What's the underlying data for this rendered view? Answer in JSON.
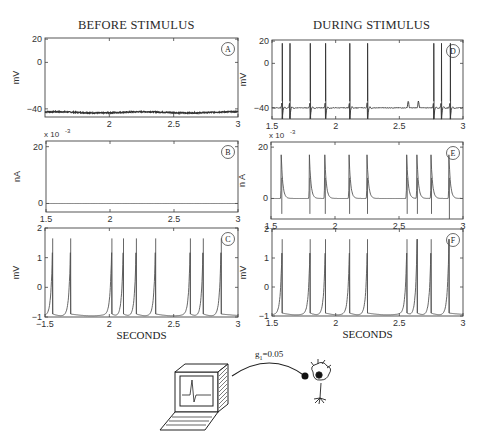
{
  "titles": {
    "left": "BEFORE STIMULUS",
    "right": "DURING STIMULUS"
  },
  "xlabel": "SECONDS",
  "scale_exponent": "x 10",
  "scale_exponent_power": "-3",
  "diagram": {
    "coupling_label": "g",
    "coupling_subscript": "1",
    "coupling_value": "=0.05"
  },
  "chart_data": [
    {
      "id": "A",
      "type": "line",
      "title": "BEFORE STIMULUS",
      "ylabel": "mV",
      "xlabel": "",
      "xlim": [
        1.5,
        3
      ],
      "ylim": [
        -47,
        21
      ],
      "xticks": [
        2,
        2.5,
        3
      ],
      "xtick_labels": [
        "2",
        "2.5",
        "3"
      ],
      "yticks": [
        20,
        0,
        -40
      ],
      "ytick_labels": [
        "20",
        "0",
        "-40"
      ],
      "description": "flat noisy resting membrane potential",
      "baseline": -43,
      "spikes": []
    },
    {
      "id": "B",
      "type": "line",
      "ylabel": "nA",
      "xlabel": "",
      "scale": "x 10^-3",
      "xlim": [
        1.5,
        3
      ],
      "ylim": [
        -3,
        22
      ],
      "xticks": [
        1.5,
        2,
        2.5,
        3
      ],
      "xtick_labels": [
        "1.5",
        "2",
        "2.5",
        "3"
      ],
      "yticks": [
        20,
        0
      ],
      "ytick_labels": [
        "20",
        "0"
      ],
      "description": "zero stimulus current",
      "baseline": 0,
      "spikes": []
    },
    {
      "id": "C",
      "type": "line",
      "ylabel": "mV",
      "xlabel": "SECONDS",
      "xlim": [
        1.5,
        3
      ],
      "ylim": [
        -1,
        2
      ],
      "xticks": [
        1.5,
        2,
        2.5,
        3
      ],
      "xtick_labels": [
        "-1.5",
        "2",
        "2.5",
        "3"
      ],
      "yticks": [
        2,
        1,
        0,
        -1
      ],
      "ytick_labels": [
        "2",
        "1",
        "0",
        "-1"
      ],
      "description": "model neuron periodic spiking (integrate-and-fire style)",
      "baseline": -0.9,
      "peak": 1.65,
      "spikes": [
        1.56,
        1.7,
        2.02,
        2.11,
        2.21,
        2.36,
        2.63,
        2.73,
        2.87
      ]
    },
    {
      "id": "D",
      "type": "line",
      "title": "DURING STIMULUS",
      "ylabel": "mV",
      "xlabel": "",
      "xlim": [
        1.5,
        3
      ],
      "ylim": [
        -50,
        21
      ],
      "xticks": [
        1.5,
        2,
        2.5,
        3
      ],
      "xtick_labels": [
        "1.5",
        "2",
        "2.5",
        "3"
      ],
      "yticks": [
        20,
        0,
        -40
      ],
      "ytick_labels": [
        "20",
        "0",
        "-40"
      ],
      "description": "real neuron firing action potentials driven by stimulus",
      "baseline": -40,
      "peak": 18,
      "spikes": [
        1.58,
        1.64,
        1.8,
        1.92,
        2.11,
        2.25,
        2.77,
        2.83,
        2.9
      ],
      "subthreshold_bumps": [
        2.57,
        2.65
      ]
    },
    {
      "id": "E",
      "type": "line",
      "ylabel": "n A",
      "xlabel": "",
      "scale": "x 10^-3",
      "xlim": [
        1.5,
        3
      ],
      "ylim": [
        -8,
        22
      ],
      "xticks": [
        1.5,
        2,
        2.5,
        3
      ],
      "xtick_labels": [
        "1.5",
        "2",
        "2.5",
        "3"
      ],
      "yticks": [
        20,
        0
      ],
      "ytick_labels": [
        "20",
        "0"
      ],
      "description": "stimulus current injected via coupling",
      "baseline": 0,
      "peak": 17,
      "spikes": [
        1.58,
        1.8,
        1.92,
        2.11,
        2.25,
        2.56,
        2.64,
        2.75,
        2.89
      ]
    },
    {
      "id": "F",
      "type": "line",
      "ylabel": "mV",
      "xlabel": "SECONDS",
      "xlim": [
        1.5,
        3
      ],
      "ylim": [
        -1,
        2
      ],
      "xticks": [
        1.5,
        2,
        2.5,
        3
      ],
      "xtick_labels": [
        "1.5",
        "2",
        "2.5",
        "3"
      ],
      "yticks": [
        2,
        1,
        0,
        -1
      ],
      "ytick_labels": [
        "2",
        "1",
        "0",
        "-1"
      ],
      "description": "model neuron spiking during stimulus",
      "baseline": -0.9,
      "peak": 1.65,
      "spikes": [
        1.58,
        1.8,
        1.92,
        2.11,
        2.25,
        2.56,
        2.64,
        2.75,
        2.89
      ]
    }
  ]
}
